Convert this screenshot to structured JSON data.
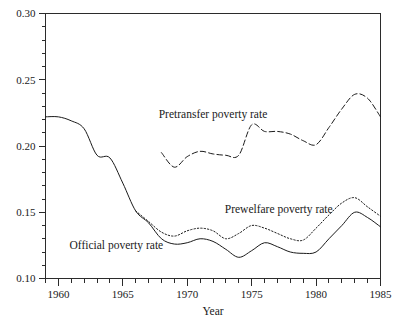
{
  "chart_data": {
    "type": "line",
    "title": "",
    "xlabel": "Year",
    "ylabel": "",
    "xlim": [
      1959,
      1985
    ],
    "ylim": [
      0.1,
      0.3
    ],
    "grid": false,
    "legend_position": "inline-annotations",
    "y_ticks": [
      "0.30",
      "0.25",
      "0.20",
      "0.15",
      "0.10"
    ],
    "y_tick_values": [
      0.3,
      0.25,
      0.2,
      0.15,
      0.1
    ],
    "y_minor_step": 0.01,
    "x_ticks": [
      "1960",
      "1965",
      "1970",
      "1975",
      "1980",
      "1985"
    ],
    "x_tick_values": [
      1960,
      1965,
      1970,
      1975,
      1980,
      1985
    ],
    "x_minor_step": 1,
    "series": [
      {
        "name": "Pretransfer poverty rate",
        "style": "dashed",
        "color": "#1a1a1a",
        "x": [
          1968,
          1969,
          1970,
          1971,
          1972,
          1973,
          1974,
          1975,
          1976,
          1977,
          1978,
          1979,
          1980,
          1981,
          1982,
          1983,
          1984,
          1985
        ],
        "values": [
          0.195,
          0.184,
          0.192,
          0.196,
          0.194,
          0.193,
          0.193,
          0.216,
          0.211,
          0.211,
          0.209,
          0.204,
          0.201,
          0.214,
          0.228,
          0.239,
          0.236,
          0.222
        ]
      },
      {
        "name": "Prewelfare poverty rate",
        "style": "dotted",
        "color": "#1a1a1a",
        "x": [
          1966,
          1967,
          1968,
          1969,
          1970,
          1971,
          1972,
          1973,
          1974,
          1975,
          1976,
          1977,
          1978,
          1979,
          1980,
          1981,
          1982,
          1983,
          1984,
          1985
        ],
        "values": [
          0.151,
          0.143,
          0.135,
          0.132,
          0.136,
          0.138,
          0.136,
          0.13,
          0.134,
          0.14,
          0.138,
          0.134,
          0.13,
          0.129,
          0.138,
          0.148,
          0.157,
          0.161,
          0.154,
          0.147
        ]
      },
      {
        "name": "Official poverty rate",
        "style": "solid",
        "color": "#1a1a1a",
        "x": [
          1959,
          1960,
          1961,
          1962,
          1963,
          1964,
          1965,
          1966,
          1967,
          1968,
          1969,
          1970,
          1971,
          1972,
          1973,
          1974,
          1975,
          1976,
          1977,
          1978,
          1979,
          1980,
          1981,
          1982,
          1983,
          1984,
          1985
        ],
        "values": [
          0.222,
          0.222,
          0.219,
          0.213,
          0.193,
          0.191,
          0.172,
          0.151,
          0.142,
          0.13,
          0.126,
          0.127,
          0.13,
          0.128,
          0.122,
          0.116,
          0.121,
          0.127,
          0.124,
          0.12,
          0.119,
          0.12,
          0.13,
          0.14,
          0.15,
          0.146,
          0.139
        ]
      }
    ],
    "annotations": [
      {
        "text": "Pretransfer poverty rate",
        "x": 1972.0,
        "y": 0.2215,
        "anchor": "middle"
      },
      {
        "text": "Prewelfare poverty rate",
        "x": 1977.1,
        "y": 0.1495,
        "anchor": "middle"
      },
      {
        "text": "Official poverty rate",
        "x": 1964.5,
        "y": 0.1225,
        "anchor": "middle"
      }
    ]
  },
  "figure": {
    "background": "#ffffff",
    "line_color": "#1a1a1a",
    "axis_color": "#2b2b2b"
  }
}
